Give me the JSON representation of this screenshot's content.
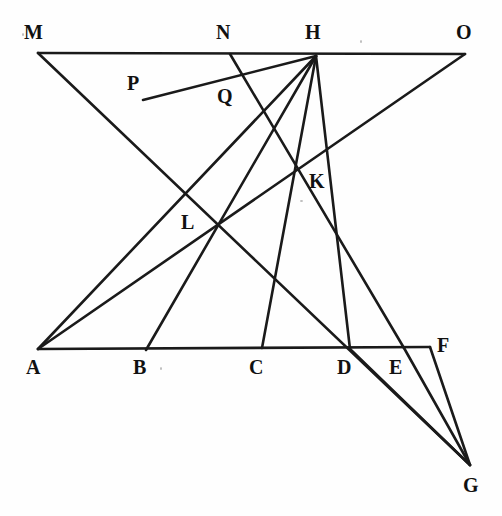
{
  "figure": {
    "type": "line-diagram",
    "background_color": "#fefefe",
    "stroke_color": "#1a1a1a",
    "label_color": "#111111",
    "width": 502,
    "height": 516
  },
  "points": [
    {
      "name": "M",
      "label": "M",
      "x": 38,
      "y": 53,
      "label_x": 24,
      "label_y": 22
    },
    {
      "name": "N",
      "label": "N",
      "x": 230,
      "y": 54,
      "label_x": 216,
      "label_y": 22
    },
    {
      "name": "H",
      "label": "H",
      "x": 316,
      "y": 56,
      "label_x": 305,
      "label_y": 22
    },
    {
      "name": "O",
      "label": "O",
      "x": 465,
      "y": 54,
      "label_x": 456,
      "label_y": 22
    },
    {
      "name": "P",
      "label": "P",
      "x": 143,
      "y": 100,
      "label_x": 127,
      "label_y": 73
    },
    {
      "name": "Q",
      "label": "Q",
      "x": 238,
      "y": 78,
      "label_x": 217,
      "label_y": 86
    },
    {
      "name": "K",
      "label": "K",
      "x": 296,
      "y": 170,
      "label_x": 309,
      "label_y": 171
    },
    {
      "name": "L",
      "label": "L",
      "x": 218,
      "y": 225,
      "label_x": 181,
      "label_y": 212
    },
    {
      "name": "A",
      "label": "A",
      "x": 38,
      "y": 349,
      "label_x": 26,
      "label_y": 357
    },
    {
      "name": "B",
      "label": "B",
      "x": 146,
      "y": 350,
      "label_x": 133,
      "label_y": 357
    },
    {
      "name": "C",
      "label": "C",
      "x": 262,
      "y": 348,
      "label_x": 249,
      "label_y": 357
    },
    {
      "name": "D",
      "label": "D",
      "x": 350,
      "y": 349,
      "label_x": 337,
      "label_y": 357
    },
    {
      "name": "E",
      "label": "E",
      "x": 404,
      "y": 348,
      "label_x": 389,
      "label_y": 357
    },
    {
      "name": "F",
      "label": "F",
      "x": 430,
      "y": 347,
      "label_x": 437,
      "label_y": 335
    },
    {
      "name": "G",
      "label": "G",
      "x": 470,
      "y": 465,
      "label_x": 463,
      "label_y": 475
    }
  ],
  "segments": [
    {
      "name": "top-line-M-O",
      "from": "M",
      "to": "O",
      "desc": "horizontal top line through N and H"
    },
    {
      "name": "base-line-A-F",
      "from": "A",
      "to": "F",
      "desc": "horizontal base line through B, C, D, E"
    },
    {
      "name": "line-M-G",
      "from": "M",
      "to": "G",
      "desc": "from M down-right through L to G"
    },
    {
      "name": "line-A-H",
      "from": "A",
      "to": "H",
      "desc": "from A up-right through L to H"
    },
    {
      "name": "line-A-O",
      "from": "A",
      "to": "O",
      "desc": "from A up-right through L and K to O"
    },
    {
      "name": "line-B-H",
      "from": "B",
      "to": "H",
      "desc": "from B up through L to H"
    },
    {
      "name": "line-C-H",
      "from": "C",
      "to": "H",
      "desc": "from C up through K to H"
    },
    {
      "name": "line-H-D",
      "from": "H",
      "to": "D",
      "desc": "from H down-right to D"
    },
    {
      "name": "line-N-E",
      "from": "N",
      "to": "E",
      "desc": "from N down-right through K to E"
    },
    {
      "name": "line-P-H",
      "from": "P",
      "to": "H",
      "desc": "short segment from P up-right to H through Q"
    },
    {
      "name": "line-D-G",
      "from": "D",
      "to": "G",
      "desc": "from D down-right to G"
    },
    {
      "name": "line-E-G",
      "from": "E",
      "to": "G",
      "desc": "from E down-right to G"
    },
    {
      "name": "line-F-G",
      "from": "F",
      "to": "G",
      "desc": "from F down-right to G"
    }
  ]
}
